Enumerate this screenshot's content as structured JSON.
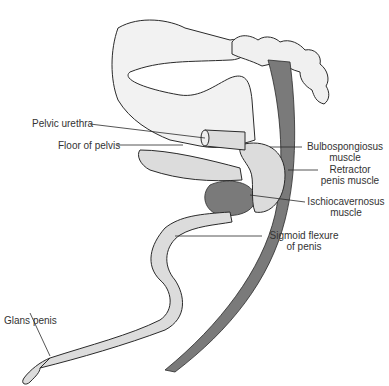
{
  "diagram": {
    "type": "anatomical illustration",
    "colors": {
      "line": "#2a2a2a",
      "bone_fill": "#f2f2f2",
      "organ_fill": "#dcdcdc",
      "muscle_fill": "#7a7a7a",
      "text": "#333333"
    },
    "labels": {
      "pelvic_urethra": "Pelvic urethra",
      "floor_of_pelvis": "Floor of pelvis",
      "bulbospongiosus_1": "Bulbospongiosus",
      "bulbospongiosus_2": "muscle",
      "retractor_1": "Retractor",
      "retractor_2": "penis muscle",
      "ischio_1": "Ischiocavernosus",
      "ischio_2": "muscle",
      "sigmoid_1": "Sigmoid flexure",
      "sigmoid_2": "of penis",
      "glans": "Glans penis"
    }
  }
}
